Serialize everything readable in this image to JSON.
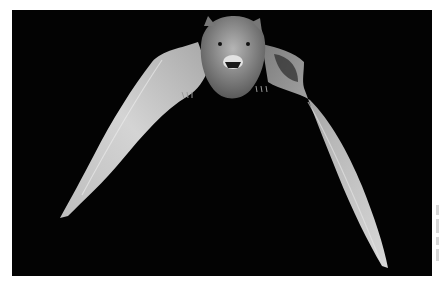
{
  "image": {
    "subject": "bat in flight",
    "description": "Black-and-white photograph of a bat flying toward the camera with wings spread, on a black background",
    "colors": {
      "background": "#030303",
      "page": "#ffffff",
      "wing_light": "#cfcfcf",
      "wing_mid": "#9a9a9a",
      "body": "#8a8a8a"
    }
  }
}
